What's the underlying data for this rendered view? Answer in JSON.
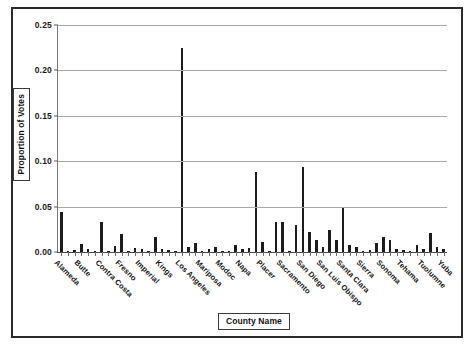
{
  "figure": {
    "width": 475,
    "height": 349,
    "background": "#ffffff",
    "frame_color": "#2b2b2b"
  },
  "axes": {
    "y_title": "Proportion of Votes",
    "x_title": "County Name",
    "y_ticks": [
      "0.00",
      "0.05",
      "0.10",
      "0.15",
      "0.20",
      "0.25"
    ]
  },
  "chart_data": {
    "type": "bar",
    "title": "",
    "subtitle": "",
    "xlabel": "County Name",
    "ylabel": "Proportion of Votes",
    "ylim": [
      0.0,
      0.25
    ],
    "yticks": [
      0.0,
      0.05,
      0.1,
      0.15,
      0.2,
      0.25
    ],
    "ytick_labels": [
      "0.00",
      "0.05",
      "0.10",
      "0.15",
      "0.20",
      "0.25"
    ],
    "grid": "horizontal",
    "legend": "none",
    "bar_color": "#1c1c1c",
    "labeled_tick_interval": 3,
    "visible_tick_labels": [
      "Alameda",
      "Butte",
      "Contra Costa",
      "Fresno",
      "Imperial",
      "Kings",
      "Los Angeles",
      "Mariposa",
      "Modoc",
      "Napa",
      "Placer",
      "Sacramento",
      "San Diego",
      "San Luis Obispo",
      "Santa Clara",
      "Sierra",
      "Sonoma",
      "Tehama",
      "Tuolumne",
      "Yuba"
    ],
    "categories": [
      "Alameda",
      "Alpine",
      "Amador",
      "Butte",
      "Calaveras",
      "Colusa",
      "Contra Costa",
      "Del Norte",
      "El Dorado",
      "Fresno",
      "Glenn",
      "Humboldt",
      "Imperial",
      "Inyo",
      "Kern",
      "Kings",
      "Lake",
      "Lassen",
      "Los Angeles",
      "Madera",
      "Marin",
      "Mariposa",
      "Mendocino",
      "Merced",
      "Modoc",
      "Mono",
      "Monterey",
      "Napa",
      "Nevada",
      "Orange",
      "Placer",
      "Plumas",
      "Riverside",
      "Sacramento",
      "San Benito",
      "San Bernardino",
      "San Diego",
      "San Francisco",
      "San Joaquin",
      "San Luis Obispo",
      "San Mateo",
      "Santa Barbara",
      "Santa Clara",
      "Santa Cruz",
      "Shasta",
      "Sierra",
      "Siskiyou",
      "Solano",
      "Sonoma",
      "Stanislaus",
      "Sutter",
      "Tehama",
      "Trinity",
      "Tulare",
      "Tuolumne",
      "Ventura",
      "Yolo",
      "Yuba"
    ],
    "values": [
      0.044,
      0.0,
      0.002,
      0.009,
      0.003,
      0.001,
      0.033,
      0.001,
      0.007,
      0.02,
      0.001,
      0.004,
      0.003,
      0.001,
      0.017,
      0.003,
      0.002,
      0.001,
      0.225,
      0.005,
      0.01,
      0.001,
      0.003,
      0.006,
      0.0,
      0.0,
      0.008,
      0.003,
      0.004,
      0.088,
      0.011,
      0.001,
      0.033,
      0.033,
      0.001,
      0.03,
      0.094,
      0.022,
      0.013,
      0.006,
      0.024,
      0.013,
      0.048,
      0.008,
      0.006,
      0.0,
      0.002,
      0.01,
      0.016,
      0.013,
      0.003,
      0.002,
      0.001,
      0.008,
      0.003,
      0.021,
      0.006,
      0.003
    ]
  }
}
